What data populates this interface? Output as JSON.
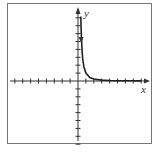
{
  "chart_data": {
    "type": "line",
    "title": "",
    "xlabel": "x",
    "ylabel": "y",
    "function_description": "decreasing curve approaching x-axis, asymptotic to y-axis (e.g. y = 1/x^2)",
    "x_ticks_left": 8,
    "x_ticks_right": 8,
    "y_ticks_up": 8,
    "y_ticks_down": 8,
    "tick_spacing_units": 1,
    "xlim": [
      -8,
      8
    ],
    "ylim": [
      -8,
      8
    ],
    "grid": false,
    "series": [
      {
        "name": "curve",
        "x": [
          0.35,
          0.4,
          0.5,
          0.6,
          0.75,
          1,
          1.5,
          2,
          3,
          4,
          5,
          6,
          7,
          8
        ],
        "y": [
          8.16,
          6.25,
          4,
          2.78,
          1.78,
          1,
          0.44,
          0.25,
          0.11,
          0.06,
          0.04,
          0.03,
          0.02,
          0.016
        ]
      }
    ],
    "axis_labels": {
      "x": "x",
      "y": "y"
    },
    "colors": {
      "axis": "#333333",
      "curve": "#222222",
      "frame": "#666666"
    }
  }
}
